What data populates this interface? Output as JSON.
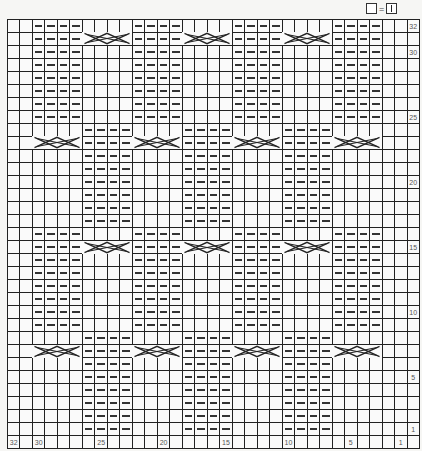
{
  "legend": {
    "symbol_left": "empty-square",
    "equals": "=",
    "symbol_right": "knit-bar-square",
    "meaning": "knit stitch"
  },
  "chart": {
    "stitches": 32,
    "rows": 32,
    "row_labels": {
      "32": "32",
      "30": "30",
      "25": "25",
      "20": "20",
      "15": "15",
      "10": "10",
      "5": "5",
      "1": "1"
    },
    "stitch_labels": [
      {
        "col": 0,
        "text": "32"
      },
      {
        "col": 2,
        "text": "30"
      },
      {
        "col": 7,
        "text": "25"
      },
      {
        "col": 12,
        "text": "20"
      },
      {
        "col": 17,
        "text": "15"
      },
      {
        "col": 22,
        "text": "10"
      },
      {
        "col": 27,
        "text": "5"
      },
      {
        "col": 31,
        "text": "1"
      }
    ],
    "sections": [
      {
        "rows": [
          25,
          32
        ],
        "purl_cols": [
          2,
          3,
          4,
          5,
          10,
          11,
          12,
          13,
          18,
          19,
          20,
          21,
          26,
          27,
          28,
          29
        ],
        "cable_row": 31,
        "cable_starts": [
          6,
          14,
          22
        ]
      },
      {
        "rows": [
          17,
          24
        ],
        "purl_cols": [
          6,
          7,
          8,
          9,
          14,
          15,
          16,
          17,
          22,
          23,
          24,
          25
        ],
        "cable_row": 23,
        "cable_starts": [
          2,
          10,
          18,
          26
        ]
      },
      {
        "rows": [
          9,
          16
        ],
        "purl_cols": [
          2,
          3,
          4,
          5,
          10,
          11,
          12,
          13,
          18,
          19,
          20,
          21,
          26,
          27,
          28,
          29
        ],
        "cable_row": 15,
        "cable_starts": [
          6,
          14,
          22
        ]
      },
      {
        "rows": [
          1,
          8
        ],
        "purl_cols": [
          6,
          7,
          8,
          9,
          14,
          15,
          16,
          17,
          22,
          23,
          24,
          25
        ],
        "cable_row": 7,
        "cable_starts": [
          2,
          10,
          18,
          26
        ]
      }
    ]
  }
}
